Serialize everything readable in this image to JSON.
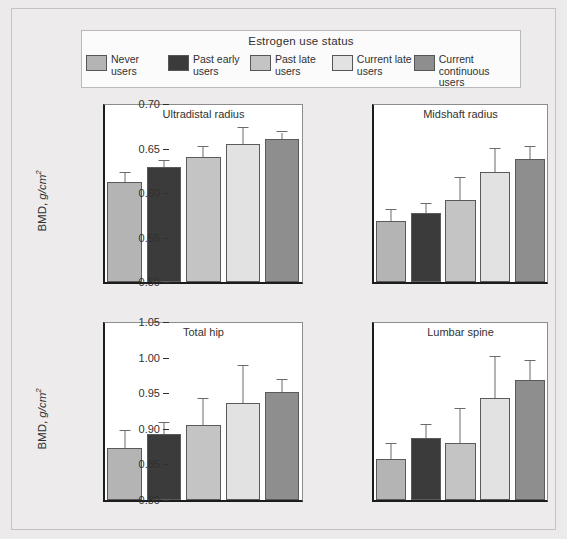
{
  "legend": {
    "title": "Estrogen use status",
    "items": [
      {
        "label": "Never\nusers",
        "color": "#b4b4b4"
      },
      {
        "label": "Past early\nusers",
        "color": "#3b3b3b"
      },
      {
        "label": "Past late\nusers",
        "color": "#c4c4c4"
      },
      {
        "label": "Current late\nusers",
        "color": "#e2e2e2"
      },
      {
        "label": "Current continuous\nusers",
        "color": "#8e8e8e"
      }
    ]
  },
  "axis_label": "BMD, g/cm",
  "axis_label_sup": "2",
  "chart_data": [
    {
      "type": "bar",
      "title": "Ultradistal radius",
      "xlabel": "",
      "ylabel": "BMD, g/cm2",
      "ylim": [
        0.1,
        0.3
      ],
      "yticks": [
        "0.10",
        "0.15",
        "0.20",
        "0.25",
        "0.30"
      ],
      "ytick_values": [
        0.1,
        0.15,
        0.2,
        0.25,
        0.3
      ],
      "grid": false,
      "legend_position": "top",
      "categories": [
        "Never users",
        "Past early users",
        "Past late users",
        "Current late users",
        "Current continuous users"
      ],
      "values": [
        0.212,
        0.229,
        0.24,
        0.255,
        0.261
      ],
      "error_upper": [
        0.222,
        0.236,
        0.252,
        0.273,
        0.268
      ],
      "colors": [
        "#b4b4b4",
        "#3b3b3b",
        "#c4c4c4",
        "#e2e2e2",
        "#8e8e8e"
      ]
    },
    {
      "type": "bar",
      "title": "Midshaft radius",
      "xlabel": "",
      "ylabel": "BMD, g/cm2",
      "ylim": [
        0.5,
        0.7
      ],
      "yticks": [
        "0.50",
        "0.55",
        "0.60",
        "0.65",
        "0.70"
      ],
      "ytick_values": [
        0.5,
        0.55,
        0.6,
        0.65,
        0.7
      ],
      "grid": false,
      "legend_position": "top",
      "categories": [
        "Never users",
        "Past early users",
        "Past late users",
        "Current late users",
        "Current continuous users"
      ],
      "values": [
        0.568,
        0.578,
        0.592,
        0.624,
        0.638
      ],
      "error_upper": [
        0.581,
        0.588,
        0.617,
        0.65,
        0.652
      ],
      "colors": [
        "#b4b4b4",
        "#3b3b3b",
        "#c4c4c4",
        "#e2e2e2",
        "#8e8e8e"
      ]
    },
    {
      "type": "bar",
      "title": "Total hip",
      "xlabel": "",
      "ylabel": "BMD, g/cm2",
      "ylim": [
        0.7,
        0.9
      ],
      "yticks": [
        "0.70",
        "0.75",
        "0.80",
        "0.85",
        "0.90"
      ],
      "ytick_values": [
        0.7,
        0.75,
        0.8,
        0.85,
        0.9
      ],
      "grid": false,
      "legend_position": "top",
      "categories": [
        "Never users",
        "Past early users",
        "Past late users",
        "Current late users",
        "Current continuous users"
      ],
      "values": [
        0.759,
        0.774,
        0.784,
        0.809,
        0.821
      ],
      "error_upper": [
        0.778,
        0.787,
        0.814,
        0.851,
        0.835
      ],
      "colors": [
        "#b4b4b4",
        "#3b3b3b",
        "#c4c4c4",
        "#e2e2e2",
        "#8e8e8e"
      ]
    },
    {
      "type": "bar",
      "title": "Lumbar spine",
      "xlabel": "",
      "ylabel": "BMD, g/cm2",
      "ylim": [
        0.8,
        1.05
      ],
      "yticks": [
        "0.80",
        "0.85",
        "0.90",
        "0.95",
        "1.00",
        "1.05"
      ],
      "ytick_values": [
        0.8,
        0.85,
        0.9,
        0.95,
        1.0,
        1.05
      ],
      "grid": false,
      "legend_position": "top",
      "categories": [
        "Never users",
        "Past early users",
        "Past late users",
        "Current late users",
        "Current continuous users"
      ],
      "values": [
        0.857,
        0.887,
        0.88,
        0.943,
        0.968
      ],
      "error_upper": [
        0.879,
        0.906,
        0.928,
        1.001,
        0.995
      ],
      "colors": [
        "#b4b4b4",
        "#3b3b3b",
        "#c4c4c4",
        "#e2e2e2",
        "#8e8e8e"
      ]
    }
  ]
}
